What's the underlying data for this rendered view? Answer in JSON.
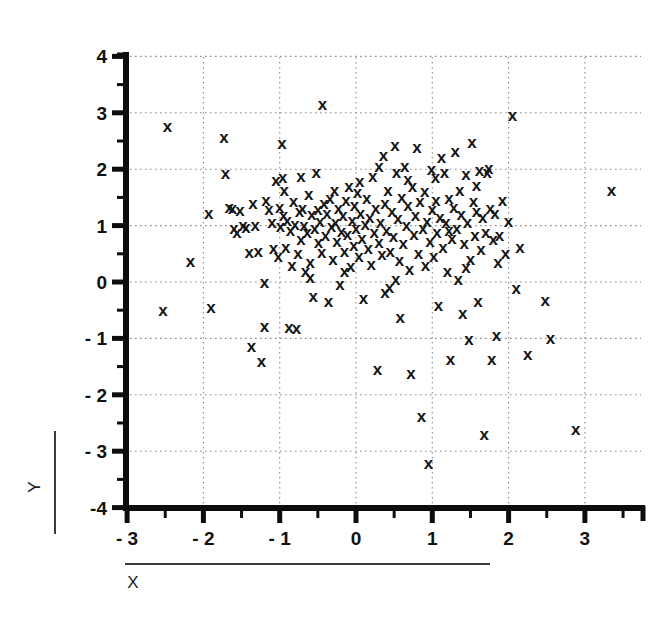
{
  "figure": {
    "background": "#ffffff",
    "ink_color": "#141414",
    "grid_color": "#8a8a8a"
  },
  "chart_data": {
    "type": "scatter",
    "title": "",
    "subtitle": "",
    "xlabel": "X",
    "ylabel": "Y",
    "xlim": [
      -3,
      3.7
    ],
    "ylim": [
      -4,
      4.35
    ],
    "xticks": [
      -3,
      -2,
      -1,
      0,
      1,
      2,
      3
    ],
    "yticks": [
      4,
      3,
      2,
      1,
      0,
      -1,
      -2,
      -3,
      -4
    ],
    "xtick_labels": [
      "- 3",
      "- 2",
      "- 1",
      "0",
      "1",
      "2",
      "3"
    ],
    "ytick_labels": [
      "4",
      "3",
      "2",
      "1",
      "0",
      "- 1",
      "- 2",
      "- 3",
      "-4"
    ],
    "minor_tick_step": 0.5,
    "grid": true,
    "grid_style": "dotted",
    "legend": false,
    "marker": "x",
    "marker_size": 17,
    "n_points": 201,
    "series": [
      {
        "name": "observations",
        "color": "#141414",
        "points": [
          [
            -2.47,
            2.75
          ],
          [
            -2.53,
            -0.5
          ],
          [
            -2.17,
            0.37
          ],
          [
            -1.93,
            1.22
          ],
          [
            -1.9,
            -0.45
          ],
          [
            -1.73,
            2.57
          ],
          [
            -1.71,
            1.93
          ],
          [
            -1.66,
            1.33
          ],
          [
            -1.62,
            1.3
          ],
          [
            -1.6,
            0.95
          ],
          [
            -1.56,
            0.88
          ],
          [
            -1.52,
            1.27
          ],
          [
            -1.48,
            1.0
          ],
          [
            -1.44,
            0.97
          ],
          [
            -1.4,
            0.52
          ],
          [
            -1.37,
            -1.14
          ],
          [
            -1.35,
            1.4
          ],
          [
            -1.32,
            1.0
          ],
          [
            -1.28,
            0.55
          ],
          [
            -1.24,
            -1.41
          ],
          [
            -1.2,
            0.0
          ],
          [
            -1.18,
            1.45
          ],
          [
            -1.14,
            1.28
          ],
          [
            -1.1,
            1.05
          ],
          [
            -1.08,
            0.6
          ],
          [
            -1.05,
            1.8
          ],
          [
            -1.02,
            0.45
          ],
          [
            -1.0,
            1.33
          ],
          [
            -0.99,
            0.98
          ],
          [
            -0.97,
            2.45
          ],
          [
            -0.96,
            1.85
          ],
          [
            -0.94,
            1.62
          ],
          [
            -0.92,
            0.62
          ],
          [
            -0.9,
            1.1
          ],
          [
            -0.88,
            -0.8
          ],
          [
            -0.86,
            0.92
          ],
          [
            -0.84,
            0.3
          ],
          [
            -0.82,
            1.42
          ],
          [
            -0.8,
            1.02
          ],
          [
            -0.78,
            -0.82
          ],
          [
            -0.76,
            0.5
          ],
          [
            -0.74,
            1.25
          ],
          [
            -0.72,
            0.75
          ],
          [
            -0.7,
            1.3
          ],
          [
            -0.68,
            1.0
          ],
          [
            -0.66,
            0.18
          ],
          [
            -0.64,
            0.88
          ],
          [
            -0.62,
            1.55
          ],
          [
            -0.6,
            0.35
          ],
          [
            -0.58,
            1.2
          ],
          [
            -0.56,
            -0.25
          ],
          [
            -0.54,
            0.95
          ],
          [
            -0.52,
            1.95
          ],
          [
            -0.5,
            1.28
          ],
          [
            -0.49,
            0.7
          ],
          [
            -0.47,
            1.08
          ],
          [
            -0.45,
            0.52
          ],
          [
            -0.44,
            3.15
          ],
          [
            -0.42,
            1.4
          ],
          [
            -0.4,
            0.82
          ],
          [
            -0.38,
            1.22
          ],
          [
            -0.36,
            -0.35
          ],
          [
            -0.34,
            1.48
          ],
          [
            -0.32,
            0.98
          ],
          [
            -0.3,
            0.4
          ],
          [
            -0.28,
            1.62
          ],
          [
            -0.27,
            1.05
          ],
          [
            -0.25,
            0.72
          ],
          [
            -0.23,
            1.3
          ],
          [
            -0.21,
            -0.05
          ],
          [
            -0.19,
            0.9
          ],
          [
            -0.17,
            1.18
          ],
          [
            -0.15,
            0.55
          ],
          [
            -0.13,
            1.45
          ],
          [
            -0.11,
            0.85
          ],
          [
            -0.09,
            1.7
          ],
          [
            -0.07,
            0.28
          ],
          [
            -0.05,
            1.1
          ],
          [
            -0.03,
            0.65
          ],
          [
            -0.02,
            1.35
          ],
          [
            0.0,
            0.95
          ],
          [
            0.02,
            1.58
          ],
          [
            0.04,
            0.45
          ],
          [
            0.06,
            1.22
          ],
          [
            0.08,
            0.78
          ],
          [
            0.1,
            -0.3
          ],
          [
            0.12,
            1.02
          ],
          [
            0.14,
            1.48
          ],
          [
            0.16,
            0.6
          ],
          [
            0.18,
            1.15
          ],
          [
            0.2,
            0.32
          ],
          [
            0.22,
            1.88
          ],
          [
            0.24,
            0.88
          ],
          [
            0.26,
            1.3
          ],
          [
            0.28,
            -1.55
          ],
          [
            0.3,
            0.7
          ],
          [
            0.32,
            1.05
          ],
          [
            0.34,
            0.48
          ],
          [
            0.36,
            2.25
          ],
          [
            0.38,
            1.4
          ],
          [
            0.4,
            0.92
          ],
          [
            0.42,
            1.62
          ],
          [
            0.44,
            -0.1
          ],
          [
            0.45,
            0.55
          ],
          [
            0.47,
            1.25
          ],
          [
            0.49,
            0.8
          ],
          [
            0.51,
            2.42
          ],
          [
            0.53,
            1.95
          ],
          [
            0.55,
            1.12
          ],
          [
            0.57,
            0.38
          ],
          [
            0.58,
            -0.62
          ],
          [
            0.6,
            1.5
          ],
          [
            0.62,
            0.68
          ],
          [
            0.64,
            2.05
          ],
          [
            0.66,
            1.0
          ],
          [
            0.68,
            1.35
          ],
          [
            0.7,
            0.22
          ],
          [
            0.72,
            -1.62
          ],
          [
            0.74,
            1.7
          ],
          [
            0.76,
            0.85
          ],
          [
            0.78,
            1.18
          ],
          [
            0.8,
            2.38
          ],
          [
            0.82,
            0.5
          ],
          [
            0.84,
            1.42
          ],
          [
            0.86,
            -2.38
          ],
          [
            0.88,
            0.95
          ],
          [
            0.9,
            1.6
          ],
          [
            0.91,
            0.3
          ],
          [
            0.93,
            1.08
          ],
          [
            0.95,
            -3.22
          ],
          [
            0.97,
            0.72
          ],
          [
            0.99,
            2.0
          ],
          [
            1.0,
            1.28
          ],
          [
            1.02,
            0.45
          ],
          [
            1.04,
            1.85
          ],
          [
            1.06,
            0.88
          ],
          [
            1.08,
            -0.42
          ],
          [
            1.1,
            1.15
          ],
          [
            1.12,
            2.2
          ],
          [
            1.14,
            0.62
          ],
          [
            1.16,
            1.95
          ],
          [
            1.18,
            1.05
          ],
          [
            1.2,
            0.18
          ],
          [
            1.22,
            1.48
          ],
          [
            1.24,
            -1.38
          ],
          [
            1.26,
            0.78
          ],
          [
            1.28,
            1.32
          ],
          [
            1.3,
            2.32
          ],
          [
            1.32,
            0.95
          ],
          [
            1.34,
            0.05
          ],
          [
            1.36,
            1.62
          ],
          [
            1.38,
            1.2
          ],
          [
            1.4,
            -0.55
          ],
          [
            1.42,
            0.68
          ],
          [
            1.44,
            1.9
          ],
          [
            1.46,
            1.05
          ],
          [
            1.48,
            -1.02
          ],
          [
            1.5,
            0.4
          ],
          [
            1.52,
            2.48
          ],
          [
            1.54,
            1.42
          ],
          [
            1.56,
            0.82
          ],
          [
            1.58,
            1.25
          ],
          [
            1.6,
            -0.35
          ],
          [
            1.62,
            1.98
          ],
          [
            1.64,
            0.58
          ],
          [
            1.66,
            1.15
          ],
          [
            1.68,
            -2.7
          ],
          [
            1.7,
            0.88
          ],
          [
            1.72,
            1.95
          ],
          [
            1.74,
            2.02
          ],
          [
            1.76,
            1.3
          ],
          [
            1.78,
            -1.38
          ],
          [
            1.8,
            0.75
          ],
          [
            1.82,
            1.22
          ],
          [
            1.84,
            -0.95
          ],
          [
            1.86,
            0.35
          ],
          [
            1.88,
            0.82
          ],
          [
            1.92,
            1.45
          ],
          [
            1.96,
            0.5
          ],
          [
            2.0,
            1.08
          ],
          [
            2.05,
            2.95
          ],
          [
            2.1,
            -0.12
          ],
          [
            2.15,
            0.62
          ],
          [
            2.25,
            -1.28
          ],
          [
            2.48,
            -0.32
          ],
          [
            2.55,
            -1.0
          ],
          [
            2.88,
            -2.62
          ],
          [
            3.35,
            1.62
          ],
          [
            -1.2,
            -0.78
          ],
          [
            -0.72,
            1.88
          ],
          [
            0.05,
            1.78
          ],
          [
            0.3,
            2.05
          ],
          [
            1.05,
            1.45
          ],
          [
            1.22,
            0.92
          ],
          [
            -0.6,
            0.08
          ],
          [
            0.52,
            0.05
          ],
          [
            1.44,
            0.25
          ],
          [
            -0.15,
            0.18
          ],
          [
            0.68,
            1.82
          ],
          [
            -0.95,
            1.18
          ],
          [
            1.58,
            1.72
          ],
          [
            0.38,
            -0.18
          ]
        ]
      }
    ]
  }
}
